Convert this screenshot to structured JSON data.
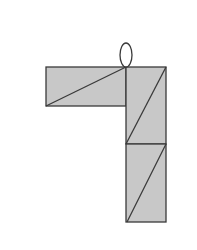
{
  "diagram": {
    "colors": {
      "background": "#ffffff",
      "fill": "#c8c8c8",
      "stroke": "#3a3a3a"
    },
    "shapes": {
      "oval": {
        "cx": 126,
        "cy": 55,
        "rx": 6,
        "ry": 12
      },
      "horizontal_bar": {
        "x": 46,
        "y": 67,
        "width": 80,
        "height": 39,
        "diagonal": [
          [
            46,
            106
          ],
          [
            126,
            67
          ]
        ]
      },
      "upper_square": {
        "x": 126,
        "y": 67,
        "width": 40,
        "height": 77,
        "diagonal": [
          [
            126,
            144
          ],
          [
            166,
            67
          ]
        ]
      },
      "lower_square": {
        "x": 126,
        "y": 144,
        "width": 40,
        "height": 78,
        "diagonal": [
          [
            127,
            222
          ],
          [
            166,
            144
          ]
        ]
      }
    }
  }
}
